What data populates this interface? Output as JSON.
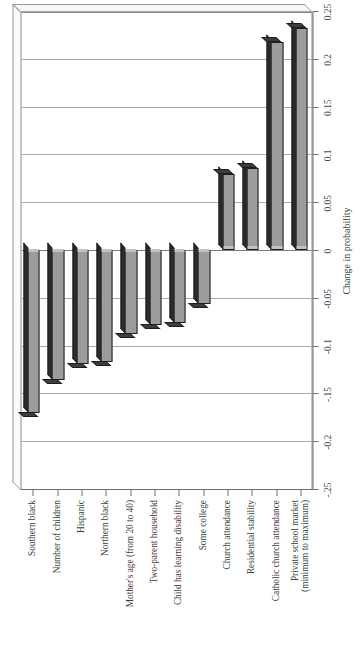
{
  "chart_data": {
    "type": "bar",
    "orientation": "horizontal",
    "title": "",
    "xlabel": "Change in probability",
    "ylabel": "",
    "xlim": [
      -0.25,
      0.25
    ],
    "grid": true,
    "legend": "none",
    "tick_labels": [
      "-.25",
      "-0.2",
      "-.15",
      "-0.1",
      "-0.05",
      "0",
      "0.05",
      "0.1",
      "0.15",
      "0.2",
      "0.25"
    ],
    "tick_values": [
      -0.25,
      -0.2,
      -0.15,
      -0.1,
      -0.05,
      0,
      0.05,
      0.1,
      0.15,
      0.2,
      0.25
    ],
    "categories": [
      "Southern black",
      "Number of children",
      "Hispanic",
      "Northern black",
      "Mother's age (from 20 to 40)",
      "Two-parent household",
      "Child has learning disability",
      "Some college",
      "Church attendance",
      "Residential stability",
      "Catholic church attendance",
      "Private school market\n(minimum to maximum)"
    ],
    "category_lines": [
      [
        "Southern black"
      ],
      [
        "Number of children"
      ],
      [
        "Hispanic"
      ],
      [
        "Northern black"
      ],
      [
        "Mother's age (from 20 to 40)"
      ],
      [
        "Two-parent household"
      ],
      [
        "Child has learning disability"
      ],
      [
        "Some college"
      ],
      [
        "Church attendance"
      ],
      [
        "Residential stability"
      ],
      [
        "Catholic church attendance"
      ],
      [
        "Private school market",
        "(minimum to maximum)"
      ]
    ],
    "values": [
      -0.17,
      -0.136,
      -0.119,
      -0.117,
      -0.088,
      -0.078,
      -0.076,
      -0.057,
      0.079,
      0.086,
      0.218,
      0.232
    ],
    "bar_color": "#9c9c9c",
    "bar_edge_color": "#1d1d1d"
  },
  "axis": {
    "value_axis_title": "Change in probability"
  }
}
